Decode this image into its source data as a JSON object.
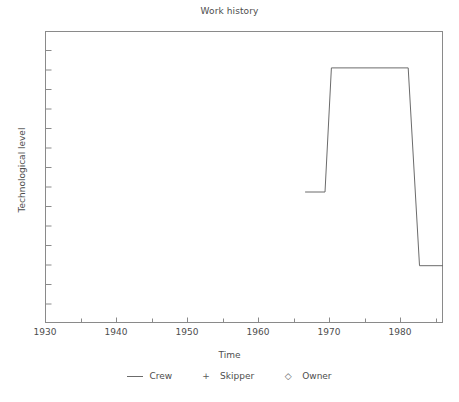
{
  "chart_data": {
    "type": "line",
    "title": "Work history",
    "xlabel": "Time",
    "ylabel": "Technological level",
    "xlim": [
      1930,
      1986
    ],
    "ylim": [
      0,
      15
    ],
    "grid": false,
    "legend_position": "bottom-center",
    "x_major_ticks": [
      1930,
      1940,
      1950,
      1960,
      1970,
      1980
    ],
    "x_minor_ticks": [
      1935,
      1945,
      1955,
      1965,
      1975,
      1985
    ],
    "x_tick_labels": [
      "1930",
      "1940",
      "1950",
      "1960",
      "1970",
      "1980"
    ],
    "y_tick_labels": [],
    "y_minor_tick_count": 15,
    "series": [
      {
        "name": "Crew",
        "marker": "line",
        "style": "step",
        "x": [
          1966.6,
          1969.4,
          1970.3,
          1981.1,
          1982.7,
          1986.0
        ],
        "y": [
          6.7,
          6.7,
          13.1,
          13.1,
          2.9,
          2.9
        ]
      },
      {
        "name": "Skipper",
        "marker": "plus",
        "x": [],
        "y": []
      },
      {
        "name": "Owner",
        "marker": "diamond",
        "x": [],
        "y": []
      }
    ],
    "legend": [
      {
        "label": "Crew",
        "marker": "line-marker",
        "glyph": ""
      },
      {
        "label": "Skipper",
        "marker": "plus-marker",
        "glyph": "+"
      },
      {
        "label": "Owner",
        "marker": "diamond-marker",
        "glyph": "◇"
      }
    ],
    "colors": {
      "line": "#6b6b6b",
      "axis": "#8a8a8a",
      "text": "#4d4d4d",
      "background": "#ffffff"
    }
  }
}
